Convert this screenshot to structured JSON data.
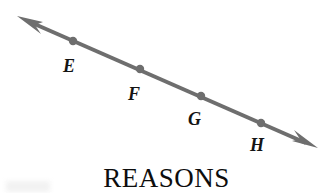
{
  "figure": {
    "background_color": "#ffffff",
    "width": 333,
    "height": 193,
    "caption": "REASONS",
    "line": {
      "type": "double-headed-ray",
      "color": "#6e6e6e",
      "stroke_width": 4,
      "start": {
        "x": 17,
        "y": 16
      },
      "end": {
        "x": 318,
        "y": 148
      },
      "arrowhead_start": true,
      "arrowhead_end": true
    },
    "points": [
      {
        "id": "E",
        "label": "E",
        "dot": {
          "x": 73,
          "y": 41
        },
        "label_pos": {
          "x": 63,
          "y": 57
        }
      },
      {
        "id": "F",
        "label": "F",
        "dot": {
          "x": 140,
          "y": 69
        },
        "label_pos": {
          "x": 128,
          "y": 85
        }
      },
      {
        "id": "G",
        "label": "G",
        "dot": {
          "x": 201,
          "y": 96
        },
        "label_pos": {
          "x": 188,
          "y": 110
        }
      },
      {
        "id": "H",
        "label": "H",
        "dot": {
          "x": 261,
          "y": 123
        },
        "label_pos": {
          "x": 250,
          "y": 136
        }
      }
    ],
    "dot_color": "#6e6e6e",
    "dot_radius": 4,
    "label_color": "#141414"
  }
}
